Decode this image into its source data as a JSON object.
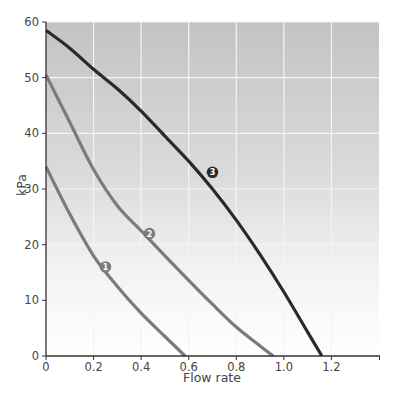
{
  "chart_data": {
    "type": "line",
    "title": "",
    "xlabel": "Flow rate",
    "ylabel": "kPa",
    "xlim": [
      0,
      1.4
    ],
    "ylim": [
      0,
      60
    ],
    "grid": true,
    "legend": "none (curves labelled with numbered circular markers)",
    "x_ticks": [
      0,
      0.2,
      0.4,
      0.6,
      0.8,
      1.0,
      1.2
    ],
    "x_tick_labels": [
      "0",
      "0.2",
      "0.4",
      "0.6",
      "0.8",
      "1.0",
      "1.2"
    ],
    "y_ticks": [
      0,
      10,
      20,
      30,
      40,
      50,
      60
    ],
    "y_tick_labels": [
      "0",
      "10",
      "20",
      "30",
      "40",
      "50",
      "60"
    ],
    "series": [
      {
        "name": "1",
        "color": "#7b7b7b",
        "points": [
          [
            0,
            34
          ],
          [
            0.1,
            25.5
          ],
          [
            0.2,
            18
          ],
          [
            0.3,
            12.5
          ],
          [
            0.4,
            7.7
          ],
          [
            0.5,
            3.5
          ],
          [
            0.585,
            0
          ]
        ],
        "label_position": [
          0.25,
          16
        ]
      },
      {
        "name": "2",
        "color": "#7b7b7b",
        "points": [
          [
            0,
            50.5
          ],
          [
            0.1,
            42
          ],
          [
            0.2,
            33.5
          ],
          [
            0.3,
            27
          ],
          [
            0.4,
            22.5
          ],
          [
            0.5,
            18
          ],
          [
            0.6,
            13.6
          ],
          [
            0.7,
            9.3
          ],
          [
            0.8,
            5.2
          ],
          [
            0.9,
            1.8
          ],
          [
            0.955,
            0
          ]
        ],
        "label_position": [
          0.435,
          22
        ]
      },
      {
        "name": "3",
        "color": "#2a2a2a",
        "points": [
          [
            0,
            58.5
          ],
          [
            0.1,
            55.3
          ],
          [
            0.2,
            51.5
          ],
          [
            0.3,
            48
          ],
          [
            0.4,
            44
          ],
          [
            0.5,
            39.5
          ],
          [
            0.6,
            35
          ],
          [
            0.7,
            30
          ],
          [
            0.8,
            24.4
          ],
          [
            0.9,
            18.2
          ],
          [
            1.0,
            11.5
          ],
          [
            1.1,
            4.3
          ],
          [
            1.16,
            0
          ]
        ],
        "label_position": [
          0.7,
          33
        ]
      }
    ]
  }
}
